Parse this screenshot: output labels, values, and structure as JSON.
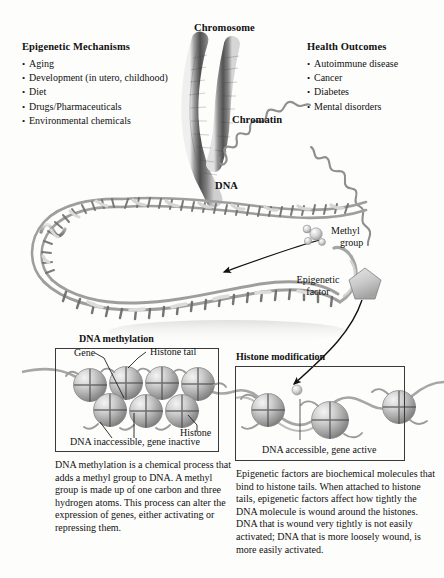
{
  "figure": {
    "title_left": "Epigenetic Mechanisms",
    "title_right": "Health Outcomes",
    "epigenetic_mechanisms": [
      "Aging",
      "Development (in utero, childhood)",
      "Diet",
      "Drugs/Pharmaceuticals",
      "Environmental chemicals"
    ],
    "health_outcomes": [
      "Autoimmune disease",
      "Cancer",
      "Diabetes",
      "Mental disorders"
    ],
    "labels": {
      "chromosome": "Chromosome",
      "chromatin": "Chromatin",
      "dna": "DNA",
      "methyl_group_line1": "Methyl",
      "methyl_group_line2": "group",
      "epigenetic_factor_line1": "Epigenetic",
      "epigenetic_factor_line2": "factor"
    },
    "panels": {
      "methylation": {
        "title": "DNA methylation",
        "gene_label": "Gene",
        "histone_tail_label": "Histone tail",
        "histone_label": "Histone",
        "caption": "DNA inaccessible, gene inactive",
        "description": "DNA methylation is a chemical process that adds a methyl group to DNA. A methyl group is made up of one carbon and three hydrogen atoms. This process can alter the expression of genes, either activating or repressing them."
      },
      "histone_modification": {
        "title": "Histone modification",
        "caption": "DNA accessible, gene active",
        "description": "Epigenetic factors are biochemical molecules that bind to histone tails.  When attached to histone tails, epigenetic factors affect how tightly the DNA molecule is wound around the histones.  DNA that is wound very tightly is not easily activated; DNA that is more loosely wound, is more easily activated."
      }
    },
    "colors": {
      "ink": "#111111",
      "panel_border": "#3a3a3a",
      "histone_fill": "#b6b6b6",
      "dna_strand": "#9a9a9a",
      "chromosome": "#6e6e6e",
      "background": "#fdfdfc"
    }
  }
}
